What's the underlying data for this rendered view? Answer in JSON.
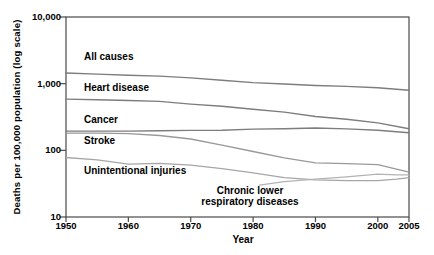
{
  "chart_data": {
    "type": "line",
    "title": "",
    "xlabel": "Year",
    "ylabel": "Deaths per 100,000 population (log scale)",
    "y_scale": "log",
    "x_range": [
      1950,
      2005
    ],
    "ylim": [
      10,
      10000
    ],
    "grid": false,
    "legend_position": "inline-labels",
    "axis_color": "#4a4a4a",
    "text_color": "#000000",
    "x_ticks": [
      {
        "value": 1950,
        "label": "1950"
      },
      {
        "value": 1960,
        "label": "1960"
      },
      {
        "value": 1970,
        "label": "1970"
      },
      {
        "value": 1980,
        "label": "1980"
      },
      {
        "value": 1990,
        "label": "1990"
      },
      {
        "value": 2000,
        "label": "2000"
      },
      {
        "value": 2005,
        "label": "2005"
      }
    ],
    "y_ticks": [
      {
        "value": 10000,
        "label": "10,000"
      },
      {
        "value": 1000,
        "label": "1,000"
      },
      {
        "value": 100,
        "label": "100"
      },
      {
        "value": 10,
        "label": "10"
      }
    ],
    "series": [
      {
        "name": "All causes",
        "color": "#7d7d7d",
        "width": 1.4,
        "x": [
          1950,
          1955,
          1960,
          1965,
          1970,
          1975,
          1980,
          1985,
          1990,
          1995,
          2000,
          2005
        ],
        "values": [
          1446,
          1391,
          1339,
          1298,
          1222,
          1122,
          1039,
          988,
          939,
          909,
          869,
          799
        ]
      },
      {
        "name": "Heart disease",
        "color": "#7d7d7d",
        "width": 1.4,
        "x": [
          1950,
          1955,
          1960,
          1965,
          1970,
          1975,
          1980,
          1985,
          1990,
          1995,
          2000,
          2005
        ],
        "values": [
          587,
          575,
          559,
          542,
          493,
          459,
          412,
          375,
          322,
          293,
          258,
          211
        ]
      },
      {
        "name": "Cancer",
        "color": "#7d7d7d",
        "width": 1.4,
        "x": [
          1950,
          1955,
          1960,
          1965,
          1970,
          1975,
          1980,
          1985,
          1990,
          1995,
          2000,
          2005
        ],
        "values": [
          194,
          194,
          194,
          196,
          199,
          200,
          208,
          211,
          216,
          210,
          200,
          184
        ]
      },
      {
        "name": "Stroke",
        "color": "#999999",
        "width": 1.3,
        "x": [
          1950,
          1955,
          1960,
          1965,
          1970,
          1975,
          1980,
          1985,
          1990,
          1995,
          2000,
          2005
        ],
        "values": [
          181,
          181,
          178,
          167,
          148,
          120,
          96,
          77,
          65,
          63,
          61,
          47
        ]
      },
      {
        "name": "Unintentional injuries",
        "color": "#a6a6a6",
        "width": 1.3,
        "x": [
          1950,
          1955,
          1960,
          1965,
          1970,
          1975,
          1980,
          1985,
          1990,
          1995,
          2000,
          2003,
          2005
        ],
        "values": [
          78,
          72,
          62,
          64,
          60,
          53,
          46,
          39,
          36,
          35,
          35,
          37,
          39
        ]
      },
      {
        "name": "Chronic lower respiratory diseases",
        "color": "#b3b3b3",
        "width": 1.3,
        "x": [
          1981,
          1985,
          1990,
          1995,
          2000,
          2003,
          2005
        ],
        "values": [
          30,
          34,
          37,
          40,
          44,
          43,
          43
        ]
      }
    ]
  }
}
